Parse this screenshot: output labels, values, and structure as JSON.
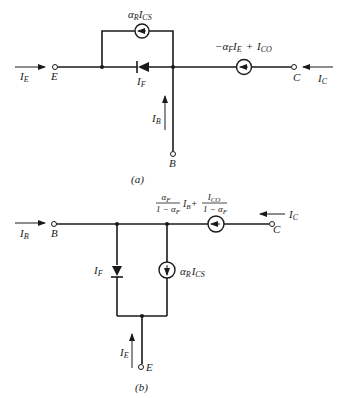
{
  "figure_a": {
    "caption": "(a)",
    "terminals": {
      "E": "E",
      "B": "B",
      "C": "C"
    },
    "currents": {
      "IE": "I",
      "IE_sub": "E",
      "IB": "I",
      "IB_sub": "B",
      "IC": "I",
      "IC_sub": "C",
      "IF": "I",
      "IF_sub": "F"
    },
    "top_source_label": {
      "alpha": "α",
      "alpha_sub": "R",
      "I": "I",
      "I_sub": "CS"
    },
    "right_source_label": {
      "prefix": "−α",
      "alpha_sub": "F",
      "I": "I",
      "I_sub": "E",
      "plus": "+",
      "I2": "I",
      "I2_sub": "CO"
    }
  },
  "figure_b": {
    "caption": "(b)",
    "terminals": {
      "B": "B",
      "C": "C",
      "E": "E"
    },
    "currents": {
      "IB": "I",
      "IB_sub": "B",
      "IC": "I",
      "IC_sub": "C",
      "IE": "I",
      "IE_sub": "E",
      "IF": "I",
      "IF_sub": "F"
    },
    "vertical_source_label": {
      "alpha": "α",
      "alpha_sub": "R",
      "I": "I",
      "I_sub": "CS"
    },
    "top_source_label": {
      "frac1_num": "α",
      "frac1_num_sub": "F",
      "frac1_den": "1 − α",
      "frac1_den_sub": "F",
      "mid": "I",
      "mid_sub": "B",
      "plus": "+",
      "frac2_num": "I",
      "frac2_num_sub": "CO",
      "frac2_den": "1 − α",
      "frac2_den_sub": "F"
    }
  }
}
